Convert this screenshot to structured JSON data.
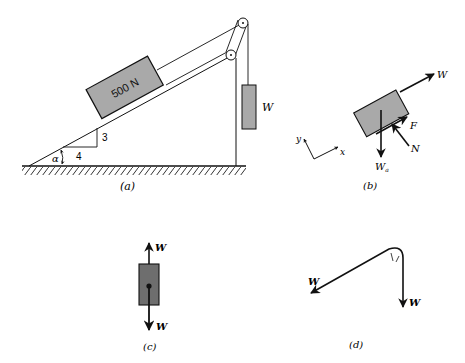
{
  "figure": {
    "panel_a": {
      "caption": "(a)",
      "block_label": "500 N",
      "hanging_weight_label": "W",
      "slope_rise": "3",
      "slope_run": "4",
      "angle_label": "α"
    },
    "panel_b": {
      "caption": "(b)",
      "force_w_label": "W",
      "force_f_label": "F",
      "force_n_label": "N",
      "force_wa_label": "W",
      "force_wa_subscript": "a",
      "axis_x_label": "x",
      "axis_y_label": "y"
    },
    "panel_c": {
      "caption": "(c)",
      "top_force_label": "W",
      "bottom_force_label": "W"
    },
    "panel_d": {
      "caption": "(d)",
      "left_force_label": "W",
      "down_force_label": "W"
    },
    "colors": {
      "block_fill": "#a9a9a9",
      "dark_block_fill": "#6e6e6e",
      "line": "#111111"
    }
  }
}
